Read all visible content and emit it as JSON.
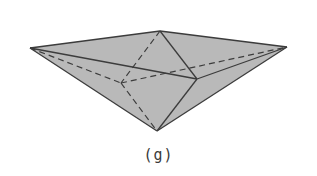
{
  "figure": {
    "caption": "(g)",
    "colors": {
      "fill": "#b9b9b9",
      "stroke": "#3c3c3c",
      "background": "#ffffff"
    },
    "vertices": {
      "left": [
        30,
        48
      ],
      "top": [
        160,
        31
      ],
      "right": [
        287,
        47
      ],
      "front": [
        197,
        79
      ],
      "back": [
        121,
        83
      ],
      "bottom": [
        157,
        131
      ]
    },
    "visible_edges": [
      [
        "left",
        "top"
      ],
      [
        "top",
        "right"
      ],
      [
        "left",
        "bottom"
      ],
      [
        "right",
        "bottom"
      ],
      [
        "left",
        "front"
      ],
      [
        "front",
        "right"
      ],
      [
        "top",
        "front"
      ],
      [
        "front",
        "bottom"
      ]
    ],
    "hidden_edges": [
      [
        "left",
        "back"
      ],
      [
        "back",
        "right"
      ],
      [
        "top",
        "back"
      ],
      [
        "back",
        "bottom"
      ]
    ]
  }
}
